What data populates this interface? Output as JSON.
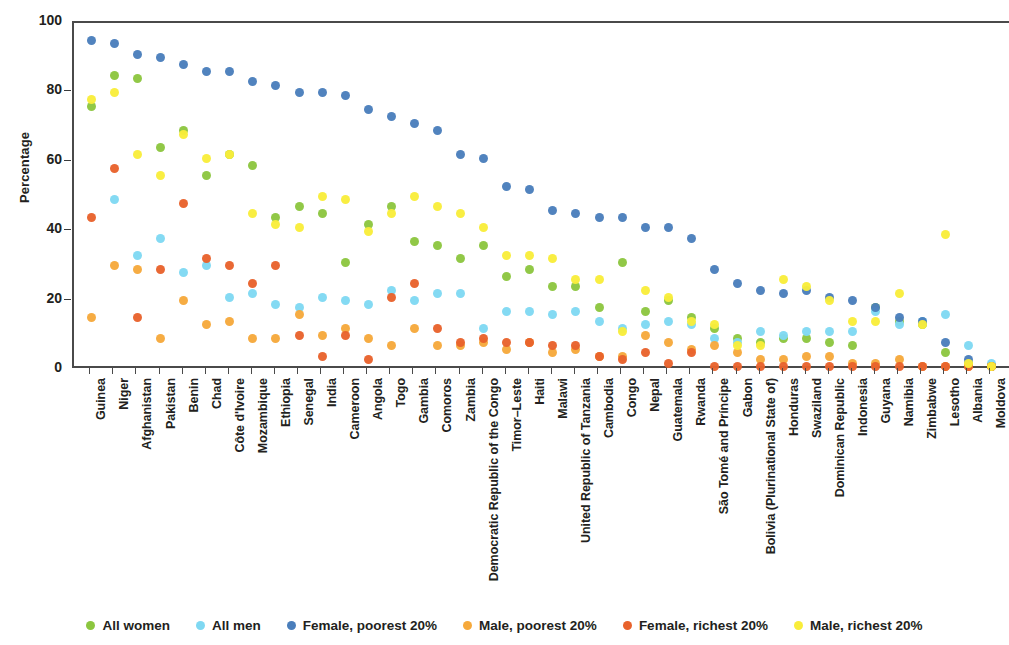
{
  "chart_data": {
    "type": "scatter",
    "title": "",
    "xlabel": "",
    "ylabel": "Percentage",
    "ylim": [
      0,
      100
    ],
    "yticks": [
      0,
      20,
      40,
      60,
      80,
      100
    ],
    "grid": false,
    "legend_position": "bottom",
    "colors": {
      "all_women": "#8cc63f",
      "all_men": "#7fd8f2",
      "female_poorest": "#4a7ebb",
      "male_poorest": "#f6a93b",
      "female_richest": "#e8622c",
      "male_richest": "#f9ed3a"
    },
    "categories": [
      "Guinea",
      "Niger",
      "Afghanistan",
      "Pakistan",
      "Benin",
      "Chad",
      "Côte d'Ivoire",
      "Mozambique",
      "Ethiopia",
      "Senegal",
      "India",
      "Cameroon",
      "Angola",
      "Togo",
      "Gambia",
      "Comoros",
      "Zambia",
      "Democratic Republic of the Congo",
      "Timor–Leste",
      "Haiti",
      "Malawi",
      "United Republic of Tanzania",
      "Cambodia",
      "Congo",
      "Nepal",
      "Guatemala",
      "Rwanda",
      "São Tomé and Príncipe",
      "Gabon",
      "Bolivia (Plurinational State of)",
      "Honduras",
      "Swaziland",
      "Dominican Republic",
      "Indonesia",
      "Guyana",
      "Namibia",
      "Zimbabwe",
      "Lesotho",
      "Albania",
      "Moldova"
    ],
    "series": [
      {
        "name": "All women",
        "key": "all_women",
        "color": "#8cc63f",
        "values": [
          76,
          85,
          84,
          64,
          69,
          56,
          62,
          59,
          44,
          47,
          45,
          31,
          42,
          47,
          37,
          36,
          32,
          36,
          27,
          29,
          24,
          24,
          18,
          31,
          17,
          20,
          15,
          12,
          9,
          8,
          9,
          9,
          8,
          7,
          18,
          14,
          13,
          5,
          2,
          1
        ]
      },
      {
        "name": "All men",
        "key": "all_men",
        "color": "#7fd8f2",
        "values": [
          null,
          49,
          33,
          38,
          28,
          30,
          21,
          22,
          19,
          18,
          21,
          20,
          19,
          23,
          20,
          22,
          22,
          12,
          17,
          17,
          16,
          17,
          14,
          12,
          13,
          14,
          13,
          9,
          8,
          11,
          10,
          11,
          11,
          11,
          17,
          13,
          14,
          16,
          7,
          2
        ]
      },
      {
        "name": "Female, poorest 20%",
        "key": "female_poorest",
        "color": "#4a7ebb",
        "values": [
          95,
          94,
          91,
          90,
          88,
          86,
          86,
          83,
          82,
          80,
          80,
          79,
          75,
          73,
          71,
          69,
          62,
          61,
          53,
          52,
          46,
          45,
          44,
          44,
          41,
          41,
          38,
          29,
          25,
          23,
          22,
          23,
          21,
          20,
          18,
          15,
          14,
          8,
          3,
          1
        ]
      },
      {
        "name": "Male, poorest 20%",
        "key": "male_poorest",
        "color": "#f6a93b",
        "values": [
          15,
          30,
          29,
          9,
          20,
          13,
          14,
          9,
          9,
          16,
          10,
          12,
          9,
          7,
          12,
          7,
          7,
          8,
          6,
          8,
          5,
          6,
          4,
          4,
          10,
          8,
          6,
          7,
          5,
          3,
          3,
          4,
          4,
          2,
          2,
          3,
          1,
          1,
          1,
          1
        ]
      },
      {
        "name": "Female, richest 20%",
        "key": "female_richest",
        "color": "#e8622c",
        "values": [
          44,
          58,
          15,
          29,
          48,
          32,
          30,
          25,
          30,
          10,
          4,
          10,
          3,
          21,
          25,
          12,
          8,
          9,
          8,
          8,
          7,
          7,
          4,
          3,
          5,
          2,
          5,
          1,
          1,
          1,
          1,
          1,
          1,
          1,
          1,
          1,
          1,
          1,
          1,
          1
        ]
      },
      {
        "name": "Male, richest 20%",
        "key": "male_richest",
        "color": "#f9ed3a",
        "values": [
          78,
          80,
          62,
          56,
          68,
          61,
          62,
          45,
          42,
          41,
          50,
          49,
          40,
          45,
          50,
          47,
          45,
          41,
          33,
          33,
          32,
          26,
          26,
          11,
          23,
          21,
          14,
          13,
          7,
          7,
          26,
          24,
          20,
          14,
          14,
          22,
          13,
          39,
          2,
          1
        ]
      }
    ]
  },
  "legend": {
    "items": [
      {
        "label": "All women",
        "color": "#8cc63f"
      },
      {
        "label": "All men",
        "color": "#7fd8f2"
      },
      {
        "label": "Female, poorest 20%",
        "color": "#4a7ebb"
      },
      {
        "label": "Male, poorest 20%",
        "color": "#f6a93b"
      },
      {
        "label": "Female, richest 20%",
        "color": "#e8622c"
      },
      {
        "label": "Male, richest 20%",
        "color": "#f9ed3a"
      }
    ]
  }
}
